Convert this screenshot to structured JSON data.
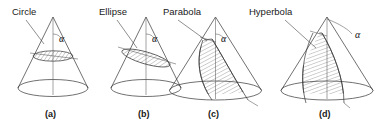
{
  "figure": {
    "background_color": "#ffffff",
    "line_color": "#333333",
    "text_color": "#1a1a1a",
    "angle_symbol": "α",
    "panels": [
      {
        "id": "a",
        "caption": "(a)",
        "label": "Circle",
        "section_type": "circle",
        "description": "Horizontal plane cuts cone perpendicular to axis forming a circle",
        "angle_label": "α"
      },
      {
        "id": "b",
        "caption": "(b)",
        "label": "Ellipse",
        "section_type": "ellipse",
        "description": "Oblique plane cuts entirely through cone forming an ellipse",
        "angle_label": "α"
      },
      {
        "id": "c",
        "caption": "(c)",
        "label": "Parabola",
        "section_type": "parabola",
        "description": "Plane parallel to a slant side cuts cone forming a parabola",
        "angle_label": "α"
      },
      {
        "id": "d",
        "caption": "(d)",
        "label": "Hyperbola",
        "section_type": "hyperbola",
        "description": "Plane steeper than slant side cuts cone forming a hyperbola",
        "angle_label": "α"
      }
    ]
  }
}
